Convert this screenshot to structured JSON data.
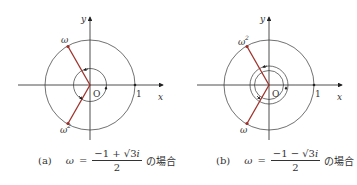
{
  "diagrams": [
    {
      "id": "a",
      "origin_label": "O",
      "x_axis_label": "x",
      "y_axis_label": "y",
      "unit_label": "1",
      "top_point_label": "ω",
      "bottom_point_label": "ω",
      "bottom_point_sup": "2",
      "top_point_sup": "",
      "inner_circles": 1,
      "segment_color": "#a0302a",
      "caption": {
        "tag": "(a)",
        "lhs": "ω",
        "eq": "=",
        "numerator": "−1 + √3",
        "numerator_i": "i",
        "denominator": "2",
        "suffix": "の場合"
      }
    },
    {
      "id": "b",
      "origin_label": "O",
      "x_axis_label": "x",
      "y_axis_label": "y",
      "unit_label": "1",
      "top_point_label": "ω",
      "top_point_sup": "2",
      "bottom_point_label": "ω",
      "bottom_point_sup": "",
      "inner_circles": 2,
      "segment_color": "#a0302a",
      "caption": {
        "tag": "(b)",
        "lhs": "ω",
        "eq": "=",
        "numerator": "−1 − √3",
        "numerator_i": "i",
        "denominator": "2",
        "suffix": "の場合"
      }
    }
  ]
}
